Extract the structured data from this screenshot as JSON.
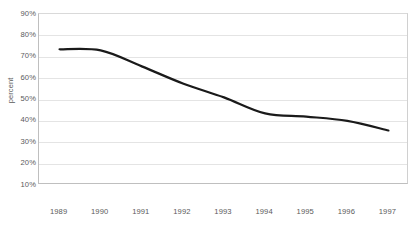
{
  "chart_data": {
    "type": "line",
    "title": "",
    "xlabel": "",
    "ylabel": "percent",
    "categories": [
      "1989",
      "1990",
      "1991",
      "1992",
      "1993",
      "1994",
      "1995",
      "1996",
      "1997"
    ],
    "values": [
      73.5,
      73,
      65.5,
      57.5,
      51,
      43.5,
      42,
      40,
      35.5
    ],
    "series": [
      {
        "name": "percent",
        "values": [
          73.5,
          73,
          65.5,
          57.5,
          51,
          43.5,
          42,
          40,
          35.5
        ]
      }
    ],
    "ylim": [
      10,
      90
    ],
    "ytick_labels": [
      "90%",
      "80%",
      "70%",
      "60%",
      "50%",
      "40%",
      "30%",
      "20%",
      "10%"
    ],
    "ytick_values": [
      90,
      80,
      70,
      60,
      50,
      40,
      30,
      20,
      10
    ],
    "grid": true,
    "legend": "none",
    "smoothed": true,
    "line_color": "#1a1a1a",
    "line_width": 2.2,
    "grid_color": "#e4e4e4",
    "axis_color": "#bfbfbf",
    "text_color": "#5a5a5a",
    "background": "#ffffff"
  },
  "title_strip": ""
}
